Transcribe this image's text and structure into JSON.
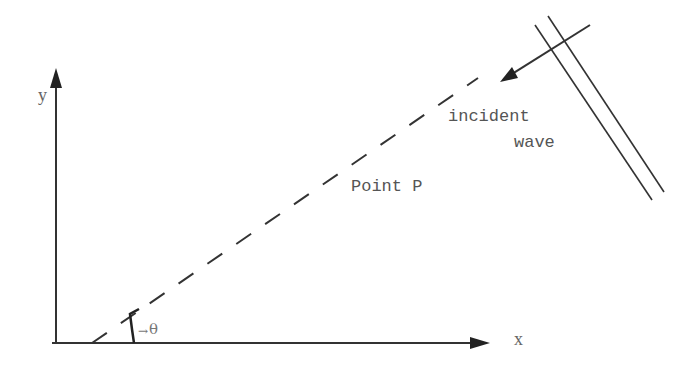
{
  "diagram": {
    "type": "geometry-wave-incidence",
    "axes": {
      "x_label": "x",
      "y_label": "y"
    },
    "angle_label": "θ",
    "angle_arrow": "→",
    "point_label": "Point P",
    "wave_label_line1": "incident",
    "wave_label_line2": "wave",
    "colors": {
      "ink": "#333333",
      "text": "#555555",
      "background": "#ffffff"
    },
    "geometry": {
      "origin": [
        56,
        343
      ],
      "x_axis_end": [
        487,
        343
      ],
      "y_axis_end": [
        56,
        70
      ],
      "dashed_line_start": [
        92,
        343
      ],
      "dashed_line_end": [
        478,
        78
      ],
      "incident_arrow_start": [
        590,
        25
      ],
      "incident_arrow_end": [
        500,
        82
      ],
      "wavefront_1": [
        [
          535,
          25
        ],
        [
          652,
          200
        ]
      ],
      "wavefront_2": [
        [
          548,
          16
        ],
        [
          664,
          192
        ]
      ]
    }
  }
}
